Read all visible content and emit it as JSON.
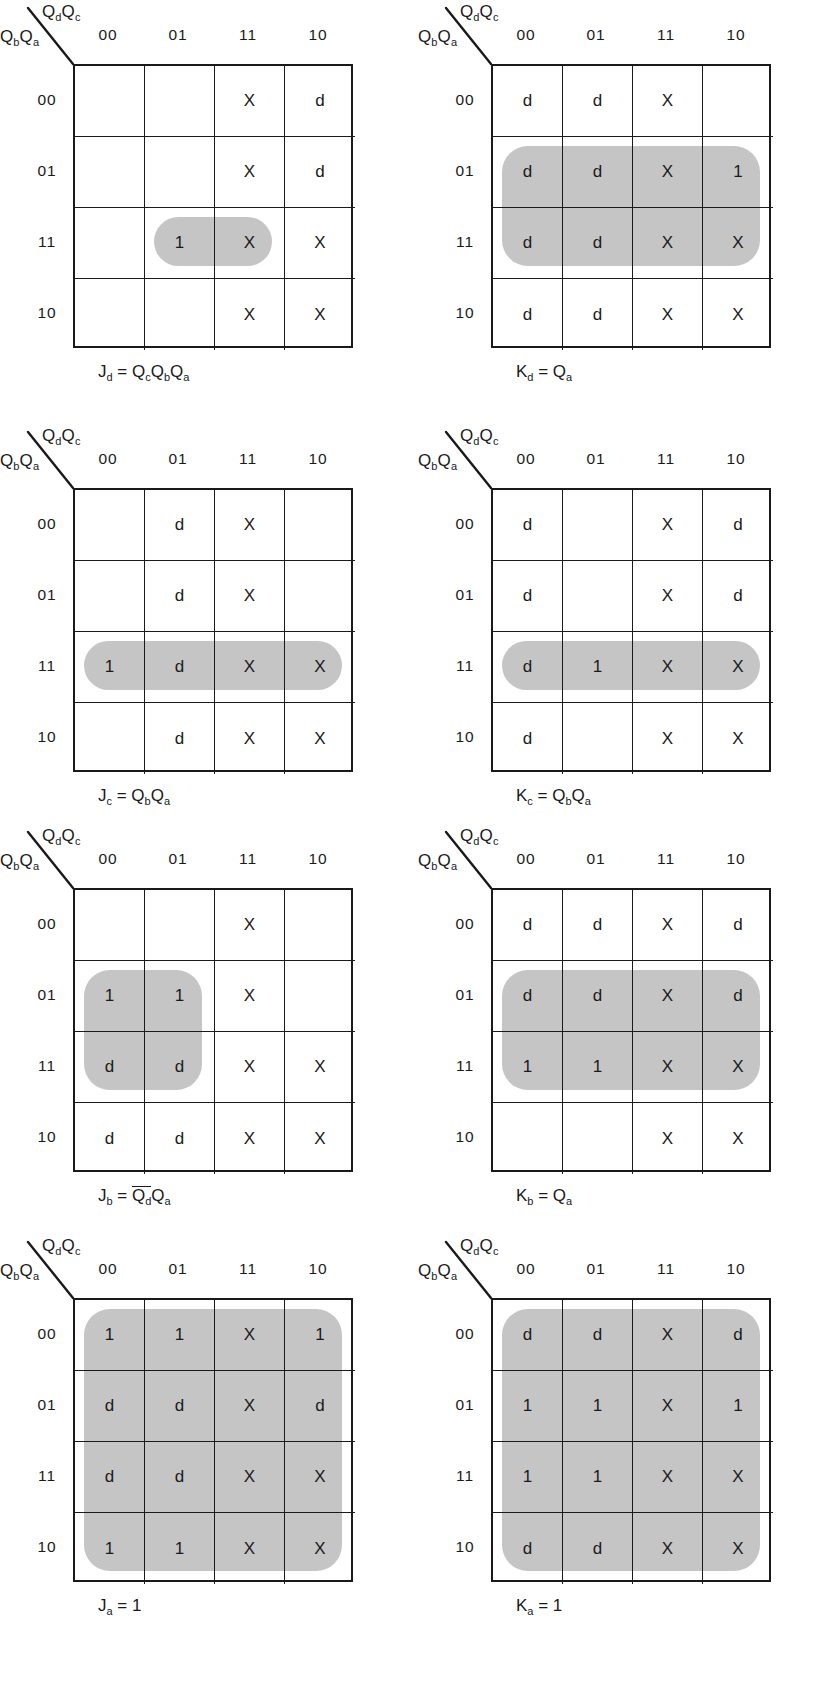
{
  "axis": {
    "top_label_html": "Q<sub>d</sub>Q<sub>c</sub>",
    "left_label_html": "Q<sub>b</sub>Q<sub>a</sub>",
    "col_headers": [
      "00",
      "01",
      "11",
      "10"
    ],
    "row_headers": [
      "00",
      "01",
      "11",
      "10"
    ]
  },
  "symbols": {
    "one": "1",
    "dont_care": "d",
    "cross": "X",
    "empty": ""
  },
  "colors": {
    "group_fill": "#b8b8b8",
    "grid_line": "#1a1a1a",
    "background": "#ffffff"
  },
  "kmaps": [
    {
      "id": "jd",
      "caption_html": "J<sub>d</sub> = Q<sub>c</sub>Q<sub>b</sub>Q<sub>a</sub>",
      "caption_text": "Jd = QcQbQa",
      "cells": [
        [
          "",
          "",
          "X",
          "d"
        ],
        [
          "",
          "",
          "X",
          "d"
        ],
        [
          "",
          "1",
          "X",
          "X"
        ],
        [
          "",
          "",
          "X",
          "X"
        ]
      ],
      "groups": [
        {
          "row": 2,
          "col": 1,
          "rows": 1,
          "cols": 2
        }
      ]
    },
    {
      "id": "kd",
      "caption_html": "K<sub>d</sub> = Q<sub>a</sub>",
      "caption_text": "Kd = Qa",
      "cells": [
        [
          "d",
          "d",
          "X",
          ""
        ],
        [
          "d",
          "d",
          "X",
          "1"
        ],
        [
          "d",
          "d",
          "X",
          "X"
        ],
        [
          "d",
          "d",
          "X",
          "X"
        ]
      ],
      "groups": [
        {
          "row": 1,
          "col": 0,
          "rows": 2,
          "cols": 4
        }
      ]
    },
    {
      "id": "jc",
      "caption_html": "J<sub>c</sub> = Q<sub>b</sub>Q<sub>a</sub>",
      "caption_text": "Jc = QbQa",
      "cells": [
        [
          "",
          "d",
          "X",
          ""
        ],
        [
          "",
          "d",
          "X",
          ""
        ],
        [
          "1",
          "d",
          "X",
          "X"
        ],
        [
          "",
          "d",
          "X",
          "X"
        ]
      ],
      "groups": [
        {
          "row": 2,
          "col": 0,
          "rows": 1,
          "cols": 4
        }
      ]
    },
    {
      "id": "kc",
      "caption_html": "K<sub>c</sub> = Q<sub>b</sub>Q<sub>a</sub>",
      "caption_text": "Kc = QbQa",
      "cells": [
        [
          "d",
          "",
          "X",
          "d"
        ],
        [
          "d",
          "",
          "X",
          "d"
        ],
        [
          "d",
          "1",
          "X",
          "X"
        ],
        [
          "d",
          "",
          "X",
          "X"
        ]
      ],
      "groups": [
        {
          "row": 2,
          "col": 0,
          "rows": 1,
          "cols": 4
        }
      ]
    },
    {
      "id": "jb",
      "caption_html": "J<sub>b</sub> = <span class=\"ovl\">Q<sub>d</sub></span>Q<sub>a</sub>",
      "caption_text": "Jb = Qd'Qa",
      "cells": [
        [
          "",
          "",
          "X",
          ""
        ],
        [
          "1",
          "1",
          "X",
          ""
        ],
        [
          "d",
          "d",
          "X",
          "X"
        ],
        [
          "d",
          "d",
          "X",
          "X"
        ]
      ],
      "groups": [
        {
          "row": 1,
          "col": 0,
          "rows": 2,
          "cols": 2
        }
      ]
    },
    {
      "id": "kb",
      "caption_html": "K<sub>b</sub> = Q<sub>a</sub>",
      "caption_text": "Kb = Qa",
      "cells": [
        [
          "d",
          "d",
          "X",
          "d"
        ],
        [
          "d",
          "d",
          "X",
          "d"
        ],
        [
          "1",
          "1",
          "X",
          "X"
        ],
        [
          "",
          "",
          "X",
          "X"
        ]
      ],
      "groups": [
        {
          "row": 1,
          "col": 0,
          "rows": 2,
          "cols": 4
        }
      ]
    },
    {
      "id": "ja",
      "caption_html": "J<sub>a</sub> = 1",
      "caption_text": "Ja = 1",
      "cells": [
        [
          "1",
          "1",
          "X",
          "1"
        ],
        [
          "d",
          "d",
          "X",
          "d"
        ],
        [
          "d",
          "d",
          "X",
          "X"
        ],
        [
          "1",
          "1",
          "X",
          "X"
        ]
      ],
      "groups": [
        {
          "row": 0,
          "col": 0,
          "rows": 4,
          "cols": 4
        }
      ]
    },
    {
      "id": "ka",
      "caption_html": "K<sub>a</sub> = 1",
      "caption_text": "Ka = 1",
      "cells": [
        [
          "d",
          "d",
          "X",
          "d"
        ],
        [
          "1",
          "1",
          "X",
          "1"
        ],
        [
          "1",
          "1",
          "X",
          "X"
        ],
        [
          "d",
          "d",
          "X",
          "X"
        ]
      ],
      "groups": [
        {
          "row": 0,
          "col": 0,
          "rows": 4,
          "cols": 4
        }
      ]
    }
  ]
}
